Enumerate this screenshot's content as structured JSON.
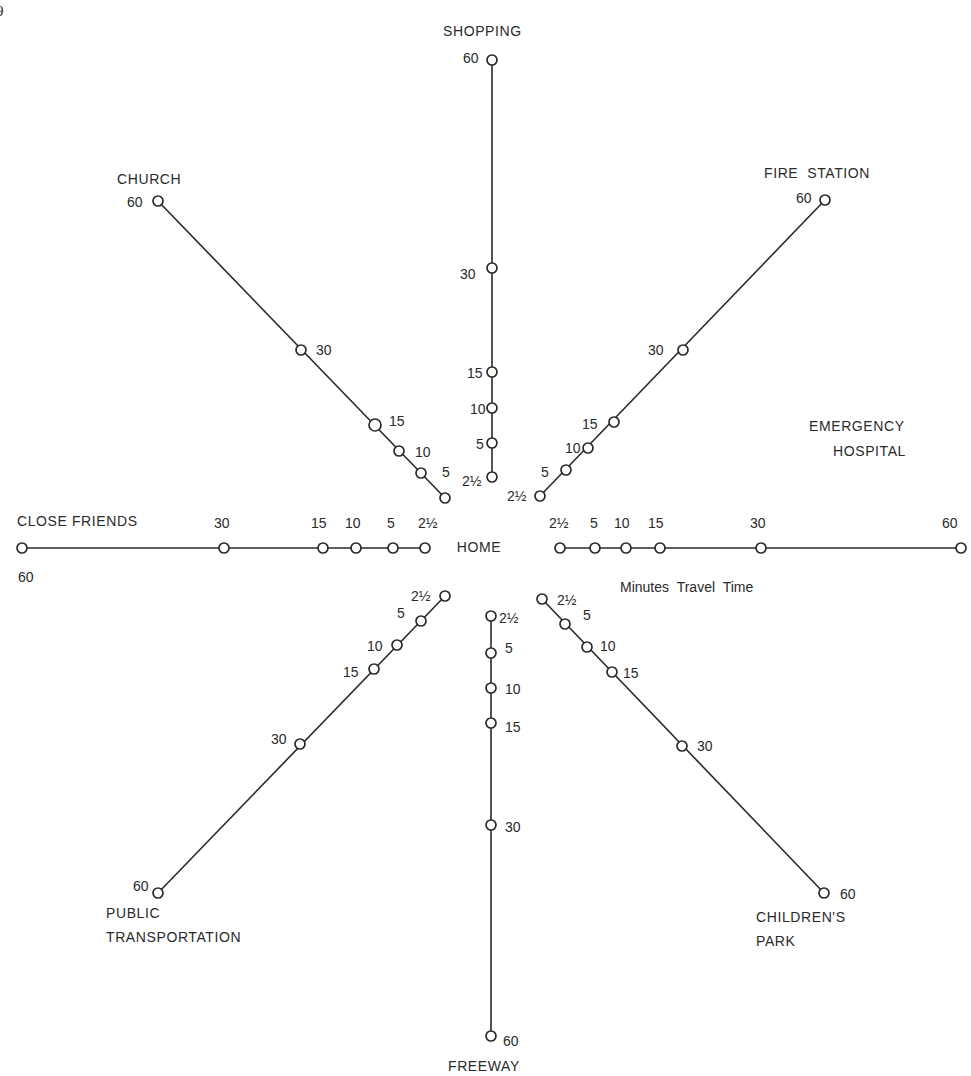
{
  "page_mark": "9",
  "center": {
    "label": "HOME",
    "x": 479,
    "y": 548
  },
  "legend": {
    "label": "Minutes  Travel  Time",
    "x": 620,
    "y": 592
  },
  "colors": {
    "ink": "#2a2a2a",
    "background": "#ffffff"
  },
  "chart_data": {
    "type": "radial-spoke",
    "title": "",
    "center": "HOME",
    "unit": "Minutes Travel Time",
    "tick_values": [
      "2½",
      "5",
      "10",
      "15",
      "30",
      "60"
    ],
    "spokes": [
      {
        "destination": "SHOPPING",
        "direction": "north",
        "values": [
          "2½",
          "5",
          "10",
          "15",
          "30",
          "60"
        ]
      },
      {
        "destination": "FIRE STATION",
        "direction": "northeast",
        "values": [
          "2½",
          "5",
          "10",
          "15",
          "30",
          "60"
        ]
      },
      {
        "destination": "EMERGENCY HOSPITAL",
        "direction": "east",
        "values": [
          "2½",
          "5",
          "10",
          "15",
          "30",
          "60"
        ]
      },
      {
        "destination": "CHILDREN'S PARK",
        "direction": "southeast",
        "values": [
          "2½",
          "5",
          "10",
          "15",
          "30",
          "60"
        ]
      },
      {
        "destination": "FREEWAY",
        "direction": "south",
        "values": [
          "2½",
          "5",
          "10",
          "15",
          "30",
          "60"
        ]
      },
      {
        "destination": "PUBLIC TRANSPORTATION",
        "direction": "southwest",
        "values": [
          "2½",
          "5",
          "10",
          "15",
          "30",
          "60"
        ]
      },
      {
        "destination": "CLOSE FRIENDS",
        "direction": "west",
        "values": [
          "2½",
          "5",
          "10",
          "15",
          "30",
          "60"
        ]
      },
      {
        "destination": "CHURCH",
        "direction": "northwest",
        "values": [
          "2½",
          "5",
          "10",
          "15",
          "30",
          "60"
        ]
      }
    ]
  },
  "spokes": [
    {
      "name": "shopping",
      "title_lines": [
        "SHOPPING"
      ],
      "title_pos": [
        [
          443,
          36
        ]
      ],
      "nodes": [
        {
          "x": 492,
          "y": 477,
          "label": "2½",
          "lx": 462,
          "ly": 486
        },
        {
          "x": 492,
          "y": 443,
          "label": "5",
          "lx": 476,
          "ly": 449
        },
        {
          "x": 492,
          "y": 408,
          "label": "10",
          "lx": 470,
          "ly": 414
        },
        {
          "x": 492,
          "y": 372,
          "label": "15",
          "lx": 467,
          "ly": 378
        },
        {
          "x": 492,
          "y": 268,
          "label": "30",
          "lx": 460,
          "ly": 279
        },
        {
          "x": 492,
          "y": 60,
          "label": "60",
          "lx": 463,
          "ly": 63
        }
      ]
    },
    {
      "name": "fire-station",
      "title_lines": [
        "FIRE  STATION"
      ],
      "title_pos": [
        [
          764,
          178
        ]
      ],
      "nodes": [
        {
          "x": 540,
          "y": 496,
          "label": "2½",
          "lx": 507,
          "ly": 501
        },
        {
          "x": 566,
          "y": 470,
          "label": "5",
          "lx": 541,
          "ly": 477
        },
        {
          "x": 588,
          "y": 448,
          "label": "10",
          "lx": 565,
          "ly": 453
        },
        {
          "x": 614,
          "y": 422,
          "label": "15",
          "lx": 582,
          "ly": 429
        },
        {
          "x": 683,
          "y": 350,
          "label": "30",
          "lx": 648,
          "ly": 355
        },
        {
          "x": 825,
          "y": 200,
          "label": "60",
          "lx": 796,
          "ly": 203
        }
      ]
    },
    {
      "name": "emergency-hospital",
      "title_lines": [
        "EMERGENCY",
        "HOSPITAL"
      ],
      "title_pos": [
        [
          809,
          431
        ],
        [
          833,
          456
        ]
      ],
      "nodes": [
        {
          "x": 560,
          "y": 548,
          "label": "2½",
          "lx": 549,
          "ly": 528
        },
        {
          "x": 595,
          "y": 548,
          "label": "5",
          "lx": 590,
          "ly": 528
        },
        {
          "x": 626,
          "y": 548,
          "label": "10",
          "lx": 614,
          "ly": 528
        },
        {
          "x": 660,
          "y": 548,
          "label": "15",
          "lx": 648,
          "ly": 528
        },
        {
          "x": 761,
          "y": 548,
          "label": "30",
          "lx": 750,
          "ly": 528
        },
        {
          "x": 961,
          "y": 548,
          "label": "60",
          "lx": 942,
          "ly": 528
        }
      ]
    },
    {
      "name": "childrens-park",
      "title_lines": [
        "CHILDREN'S",
        "PARK"
      ],
      "title_pos": [
        [
          756,
          922
        ],
        [
          756,
          946
        ]
      ],
      "nodes": [
        {
          "x": 542,
          "y": 599,
          "label": "2½",
          "lx": 557,
          "ly": 605
        },
        {
          "x": 565,
          "y": 624,
          "label": "5",
          "lx": 583,
          "ly": 620
        },
        {
          "x": 587,
          "y": 647,
          "label": "10",
          "lx": 600,
          "ly": 651
        },
        {
          "x": 612,
          "y": 672,
          "label": "15",
          "lx": 623,
          "ly": 678
        },
        {
          "x": 682,
          "y": 746,
          "label": "30",
          "lx": 697,
          "ly": 751
        },
        {
          "x": 824,
          "y": 893,
          "label": "60",
          "lx": 840,
          "ly": 899
        }
      ]
    },
    {
      "name": "freeway",
      "title_lines": [
        "FREEWAY"
      ],
      "title_pos": [
        [
          448,
          1071
        ]
      ],
      "nodes": [
        {
          "x": 491,
          "y": 616,
          "label": "2½",
          "lx": 499,
          "ly": 623
        },
        {
          "x": 491,
          "y": 653,
          "label": "5",
          "lx": 505,
          "ly": 653
        },
        {
          "x": 491,
          "y": 688,
          "label": "10",
          "lx": 505,
          "ly": 694
        },
        {
          "x": 491,
          "y": 723,
          "label": "15",
          "lx": 505,
          "ly": 732
        },
        {
          "x": 491,
          "y": 825,
          "label": "30",
          "lx": 505,
          "ly": 832
        },
        {
          "x": 491,
          "y": 1036,
          "label": "60",
          "lx": 503,
          "ly": 1046
        }
      ]
    },
    {
      "name": "public-transportation",
      "title_lines": [
        "PUBLIC",
        "TRANSPORTATION"
      ],
      "title_pos": [
        [
          106,
          918
        ],
        [
          106,
          942
        ]
      ],
      "nodes": [
        {
          "x": 445,
          "y": 596,
          "label": "2½",
          "lx": 411,
          "ly": 601
        },
        {
          "x": 421,
          "y": 621,
          "label": "5",
          "lx": 397,
          "ly": 618
        },
        {
          "x": 397,
          "y": 645,
          "label": "10",
          "lx": 367,
          "ly": 651
        },
        {
          "x": 374,
          "y": 669,
          "label": "15",
          "lx": 343,
          "ly": 677
        },
        {
          "x": 300,
          "y": 744,
          "label": "30",
          "lx": 271,
          "ly": 744
        },
        {
          "x": 158,
          "y": 893,
          "label": "60",
          "lx": 133,
          "ly": 891
        }
      ]
    },
    {
      "name": "close-friends",
      "title_lines": [
        "CLOSE FRIENDS"
      ],
      "title_pos": [
        [
          17,
          526
        ]
      ],
      "nodes": [
        {
          "x": 425,
          "y": 548,
          "label": "2½",
          "lx": 418,
          "ly": 528
        },
        {
          "x": 393,
          "y": 548,
          "label": "5",
          "lx": 387,
          "ly": 528
        },
        {
          "x": 356,
          "y": 548,
          "label": "10",
          "lx": 345,
          "ly": 528
        },
        {
          "x": 323,
          "y": 548,
          "label": "15",
          "lx": 311,
          "ly": 528
        },
        {
          "x": 224,
          "y": 548,
          "label": "30",
          "lx": 214,
          "ly": 528
        },
        {
          "x": 22,
          "y": 548,
          "label": "60",
          "lx": 18,
          "ly": 582
        }
      ]
    },
    {
      "name": "church",
      "title_lines": [
        "CHURCH"
      ],
      "title_pos": [
        [
          117,
          184
        ]
      ],
      "nodes": [
        {
          "x": 445,
          "y": 498,
          "label": "",
          "lx": 0,
          "ly": 0
        },
        {
          "x": 421,
          "y": 473,
          "label": "5",
          "lx": 442,
          "ly": 477
        },
        {
          "x": 399,
          "y": 451,
          "label": "10",
          "lx": 415,
          "ly": 457
        },
        {
          "x": 375,
          "y": 425,
          "label": "15",
          "lx": 389,
          "ly": 426
        },
        {
          "x": 301,
          "y": 350,
          "label": "30",
          "lx": 316,
          "ly": 355
        },
        {
          "x": 158,
          "y": 201,
          "label": "60",
          "lx": 127,
          "ly": 207
        }
      ]
    }
  ]
}
